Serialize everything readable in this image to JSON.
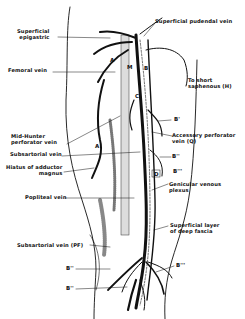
{
  "figure": {
    "labels_left": [
      {
        "id": "superficial-epigastric",
        "lines": [
          "Superficial",
          "epigastric"
        ],
        "x": 17,
        "y": 29
      },
      {
        "id": "femoral-vein",
        "lines": [
          "Femoral vein"
        ],
        "x": 8,
        "y": 70
      },
      {
        "id": "mid-hunter-perforator",
        "lines": [
          "Mid-Hunter",
          "perforator vein"
        ],
        "x": 11,
        "y": 137
      },
      {
        "id": "subsartorial-vein",
        "lines": [
          "Subsartorial vein"
        ],
        "x": 10,
        "y": 154
      },
      {
        "id": "hiatus-adductor-magnus",
        "lines": [
          "Hiatus of adductor",
          "magnus"
        ],
        "x": 6,
        "y": 166
      },
      {
        "id": "popliteal-vein",
        "lines": [
          "Popliteal vein"
        ],
        "x": 25,
        "y": 196
      },
      {
        "id": "subsartorial-vein-pf",
        "lines": [
          "Subsartorial vein (PF)"
        ],
        "x": 17,
        "y": 243
      }
    ],
    "labels_right": [
      {
        "id": "superficial-pudendal",
        "lines": [
          "Superficial pudendal vein"
        ],
        "x": 154,
        "y": 20
      },
      {
        "id": "to-short-saphenous",
        "lines": [
          "To short",
          "saphenous (H)"
        ],
        "x": 188,
        "y": 79
      },
      {
        "id": "accessory-perforator",
        "lines": [
          "Accessory perforator",
          "vein (Q)"
        ],
        "x": 172,
        "y": 134
      },
      {
        "id": "genicular-plexus",
        "lines": [
          "Genicular venous",
          "plexus"
        ],
        "x": 169,
        "y": 182
      },
      {
        "id": "superficial-layer-deep-fascia",
        "lines": [
          "Superficial layer",
          "of deep fascia"
        ],
        "x": 170,
        "y": 224
      }
    ],
    "letters": [
      {
        "text": "A",
        "x": 110,
        "y": 60
      },
      {
        "text": "B",
        "x": 144,
        "y": 68
      },
      {
        "text": "M",
        "x": 128,
        "y": 66
      },
      {
        "text": "C",
        "x": 136,
        "y": 95
      },
      {
        "text": "A",
        "x": 95,
        "y": 145
      },
      {
        "text": "D",
        "x": 154,
        "y": 172
      },
      {
        "text": "B'",
        "x": 174,
        "y": 118
      },
      {
        "text": "B''",
        "x": 172,
        "y": 154
      },
      {
        "text": "B'''",
        "x": 173,
        "y": 170
      },
      {
        "text": "B'''",
        "x": 176,
        "y": 186
      },
      {
        "text": "B''",
        "x": 66,
        "y": 266
      },
      {
        "text": "B''",
        "x": 66,
        "y": 286
      },
      {
        "text": "B'''",
        "x": 176,
        "y": 264
      }
    ]
  }
}
